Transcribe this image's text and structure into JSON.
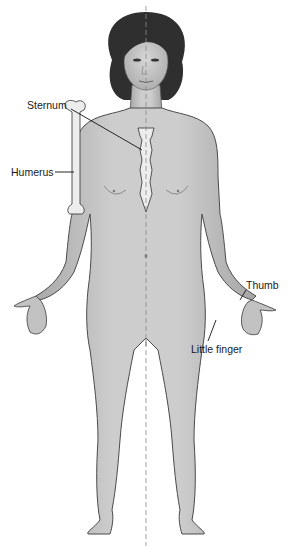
{
  "diagram": {
    "midline": "dashed vertical midline",
    "labels": [
      {
        "id": "sternum",
        "text": "Sternum"
      },
      {
        "id": "humerus",
        "text": "Humerus"
      },
      {
        "id": "thumb",
        "text": "Thumb"
      },
      {
        "id": "little_finger",
        "text": "Little finger"
      }
    ]
  },
  "colors": {
    "skin": "#c4c4c4",
    "skin_shadow": "#9a9a9a",
    "outline": "#4a4a4a",
    "hair": "#2e2e2e",
    "bone": "#ececec",
    "leader": "#111111",
    "midline": "#8a8a8a"
  }
}
